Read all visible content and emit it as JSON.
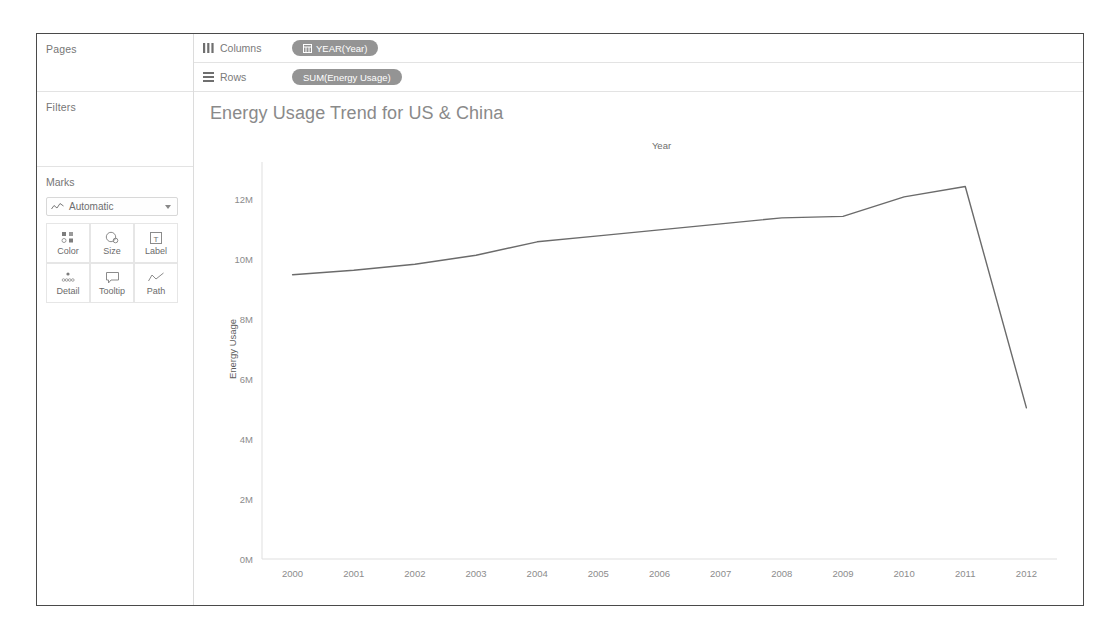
{
  "sidebar": {
    "pages": {
      "title": "Pages"
    },
    "filters": {
      "title": "Filters"
    },
    "marks": {
      "title": "Marks",
      "mark_type": "Automatic",
      "mark_type_icon": "line-chart-icon",
      "dropdown_icon": "chevron-down-icon",
      "buttons": [
        {
          "label": "Color",
          "icon": "color-squares-icon"
        },
        {
          "label": "Size",
          "icon": "size-circles-icon"
        },
        {
          "label": "Label",
          "icon": "label-text-icon"
        },
        {
          "label": "Detail",
          "icon": "detail-dots-icon"
        },
        {
          "label": "Tooltip",
          "icon": "tooltip-bubble-icon"
        },
        {
          "label": "Path",
          "icon": "path-line-icon"
        }
      ]
    }
  },
  "shelves": [
    {
      "name": "Columns",
      "icon": "columns-icon",
      "pill": "YEAR(Year)",
      "pill_icon": "calendar-icon"
    },
    {
      "name": "Rows",
      "icon": "rows-icon",
      "pill": "SUM(Energy Usage)",
      "pill_icon": ""
    }
  ],
  "viz": {
    "title": "Energy Usage Trend for US & China",
    "column_header": "Year",
    "y_axis_title": "Energy Usage"
  },
  "chart_data": {
    "type": "line",
    "title": "Energy Usage Trend for US & China",
    "xlabel": "Year",
    "ylabel": "Energy Usage",
    "x": [
      2000,
      2001,
      2002,
      2003,
      2004,
      2005,
      2006,
      2007,
      2008,
      2009,
      2010,
      2011,
      2012
    ],
    "xtick_labels": [
      "2000",
      "2001",
      "2002",
      "2003",
      "2004",
      "2005",
      "2006",
      "2007",
      "2008",
      "2009",
      "2010",
      "2011",
      "2012"
    ],
    "ytick_labels": [
      "0M",
      "2M",
      "4M",
      "6M",
      "8M",
      "10M",
      "12M"
    ],
    "ytick_values": [
      0,
      2000000,
      4000000,
      6000000,
      8000000,
      10000000,
      12000000
    ],
    "ylim": [
      0,
      13000000
    ],
    "grid": false,
    "legend": "none",
    "series": [
      {
        "name": "SUM(Energy Usage)",
        "color": "#6b6b6b",
        "values": [
          9500000,
          9650000,
          9850000,
          10150000,
          10600000,
          10800000,
          11000000,
          11200000,
          11400000,
          11450000,
          12100000,
          12450000,
          5050000
        ]
      }
    ]
  }
}
